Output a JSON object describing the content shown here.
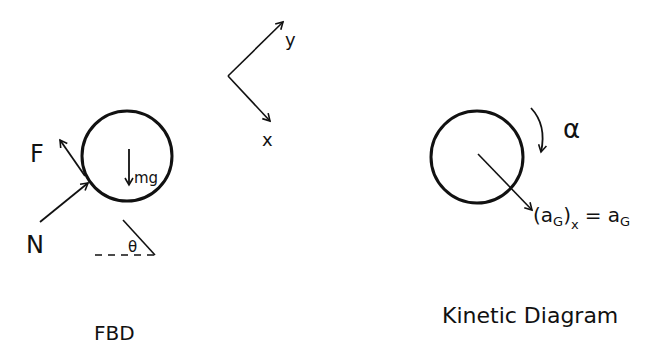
{
  "fbd": {
    "title": "FBD",
    "forces": {
      "friction": "F",
      "normal": "N",
      "weight": "mg"
    },
    "angle": "θ"
  },
  "axes": {
    "y": "y",
    "x": "x"
  },
  "kinetic": {
    "title": "Kinetic Diagram",
    "angular_accel": "α",
    "accel_lhs": "(a",
    "accel_lhs_sub": "G",
    "accel_lhs_close": ")",
    "accel_lhs_comp": "x",
    "accel_rhs": "= a",
    "accel_rhs_sub": "G"
  }
}
